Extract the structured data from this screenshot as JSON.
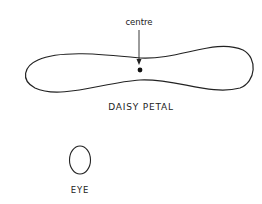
{
  "diagram": {
    "petal": {
      "title": "DAISY PETAL",
      "annotation": "centre"
    },
    "eye": {
      "title": "EYE"
    },
    "colors": {
      "stroke": "#222222",
      "background": "#ffffff"
    }
  }
}
